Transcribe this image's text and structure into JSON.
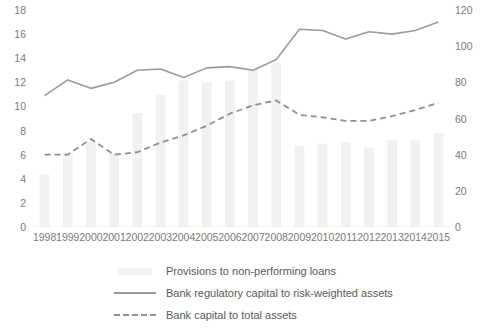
{
  "chart_data": {
    "type": "bar",
    "title": "",
    "xlabel": "",
    "ylabel": "",
    "grid": false,
    "legend_position": "bottom",
    "categories": [
      "1998",
      "1999",
      "2000",
      "2001",
      "2002",
      "2003",
      "2004",
      "2005",
      "2006",
      "2007",
      "2008",
      "2009",
      "2010",
      "2011",
      "2012",
      "2013",
      "2014",
      "2015"
    ],
    "axes": {
      "left": {
        "label": "",
        "min": 0,
        "max": 18,
        "step": 2,
        "ticks": [
          "0",
          "2",
          "4",
          "6",
          "8",
          "10",
          "12",
          "14",
          "16",
          "18"
        ]
      },
      "right": {
        "label": "",
        "min": 0,
        "max": 120,
        "step": 20,
        "ticks": [
          "0",
          "20",
          "40",
          "60",
          "80",
          "100",
          "120"
        ]
      }
    },
    "series": [
      {
        "name": "Provisions to non-performing loans",
        "type": "bar",
        "axis": "right",
        "color": "#f1f1f1",
        "values": [
          29,
          41,
          47,
          41,
          63,
          73,
          81,
          80,
          81,
          87,
          91,
          45,
          46,
          47,
          44,
          48,
          48,
          52
        ]
      },
      {
        "name": "Bank regulatory capital to risk-weighted assets",
        "type": "line",
        "style": "solid",
        "axis": "left",
        "color": "#9b9b9b",
        "values": [
          10.9,
          12.2,
          11.5,
          12.0,
          13.0,
          13.1,
          12.4,
          13.2,
          13.3,
          13.0,
          13.9,
          16.4,
          16.3,
          15.6,
          16.2,
          16.0,
          16.3,
          17.0
        ]
      },
      {
        "name": "Bank capital to total assets",
        "type": "line",
        "style": "dashed",
        "axis": "left",
        "color": "#8f8f8f",
        "values": [
          6.0,
          6.0,
          7.3,
          6.0,
          6.2,
          7.0,
          7.6,
          8.4,
          9.4,
          10.1,
          10.5,
          9.3,
          9.1,
          8.8,
          8.8,
          9.2,
          9.7,
          10.3
        ]
      }
    ]
  },
  "legend": {
    "items": [
      {
        "label": "Provisions to non-performing loans",
        "key": "bar-swatch"
      },
      {
        "label": "Bank regulatory capital to risk-weighted assets",
        "key": "solid-line-swatch"
      },
      {
        "label": "Bank capital to total assets",
        "key": "dashed-line-swatch"
      }
    ]
  }
}
